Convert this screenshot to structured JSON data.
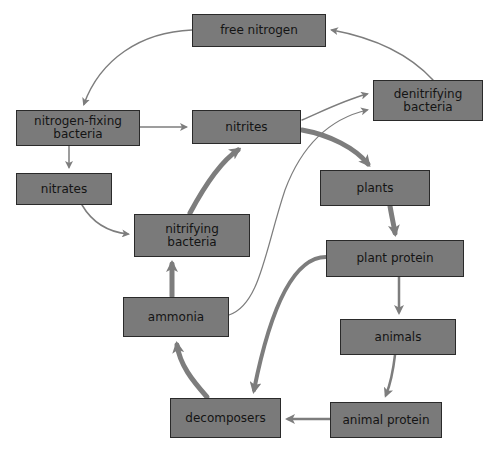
{
  "diagram": {
    "type": "nitrogen-cycle",
    "colors": {
      "box_fill": "#7a7a7a",
      "box_border": "#2a2a2a",
      "arrow": "#7d7d7d",
      "text": "#141414",
      "background": "#ffffff"
    },
    "nodes": [
      {
        "id": "free_nitrogen",
        "label": "free nitrogen",
        "x": 192,
        "y": 14,
        "w": 134,
        "h": 33
      },
      {
        "id": "denitrifying_bacteria",
        "label": "denitrifying\nbacteria",
        "x": 373,
        "y": 80,
        "w": 110,
        "h": 41
      },
      {
        "id": "nitrogen_fixing_bacteria",
        "label": "nitrogen-fixing\nbacteria",
        "x": 16,
        "y": 110,
        "w": 124,
        "h": 36
      },
      {
        "id": "nitrites",
        "label": "nitrites",
        "x": 192,
        "y": 110,
        "w": 109,
        "h": 34
      },
      {
        "id": "nitrates",
        "label": "nitrates",
        "x": 16,
        "y": 173,
        "w": 96,
        "h": 32
      },
      {
        "id": "plants",
        "label": "plants",
        "x": 320,
        "y": 170,
        "w": 110,
        "h": 36
      },
      {
        "id": "nitrifying_bacteria",
        "label": "nitrifying\nbacteria",
        "x": 134,
        "y": 214,
        "w": 116,
        "h": 43
      },
      {
        "id": "plant_protein",
        "label": "plant protein",
        "x": 326,
        "y": 240,
        "w": 138,
        "h": 37
      },
      {
        "id": "ammonia",
        "label": "ammonia",
        "x": 123,
        "y": 297,
        "w": 106,
        "h": 40
      },
      {
        "id": "animals",
        "label": "animals",
        "x": 340,
        "y": 319,
        "w": 116,
        "h": 36
      },
      {
        "id": "decomposers",
        "label": "decomposers",
        "x": 170,
        "y": 398,
        "w": 111,
        "h": 40
      },
      {
        "id": "animal_protein",
        "label": "animal protein",
        "x": 330,
        "y": 402,
        "w": 112,
        "h": 36
      }
    ],
    "edges": [
      {
        "from": "free_nitrogen",
        "to": "nitrogen_fixing_bacteria",
        "weight": "thin"
      },
      {
        "from": "denitrifying_bacteria",
        "to": "free_nitrogen",
        "weight": "thin"
      },
      {
        "from": "nitrogen_fixing_bacteria",
        "to": "nitrites",
        "weight": "thin"
      },
      {
        "from": "nitrogen_fixing_bacteria",
        "to": "nitrates",
        "weight": "thin"
      },
      {
        "from": "nitrates",
        "to": "nitrifying_bacteria",
        "weight": "thin"
      },
      {
        "from": "nitrites",
        "to": "denitrifying_bacteria",
        "weight": "thin"
      },
      {
        "from": "ammonia",
        "to": "denitrifying_bacteria",
        "weight": "thin"
      },
      {
        "from": "nitrites",
        "to": "plants",
        "weight": "thick"
      },
      {
        "from": "nitrifying_bacteria",
        "to": "nitrites",
        "weight": "thick"
      },
      {
        "from": "ammonia",
        "to": "nitrifying_bacteria",
        "weight": "thick"
      },
      {
        "from": "decomposers",
        "to": "ammonia",
        "weight": "thick"
      },
      {
        "from": "plants",
        "to": "plant_protein",
        "weight": "thick"
      },
      {
        "from": "plant_protein",
        "to": "decomposers",
        "weight": "thick"
      },
      {
        "from": "plant_protein",
        "to": "animals",
        "weight": "medium"
      },
      {
        "from": "animals",
        "to": "animal_protein",
        "weight": "medium"
      },
      {
        "from": "animal_protein",
        "to": "decomposers",
        "weight": "medium"
      }
    ]
  }
}
